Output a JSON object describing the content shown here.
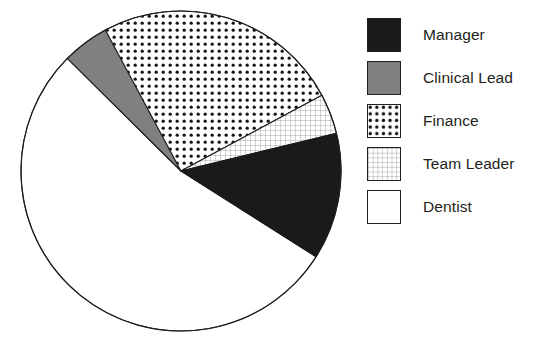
{
  "chart_data": {
    "type": "pie",
    "title": "",
    "subtitle": "",
    "xlabel": "",
    "ylabel": "",
    "grid": false,
    "legend_position": "right",
    "center": {
      "x": 181,
      "y": 171
    },
    "radius": 160,
    "categories": [
      "Manager",
      "Clinical Lead",
      "Finance",
      "Team Leader",
      "Dentist"
    ],
    "values": [
      12.8,
      4.8,
      25.0,
      4.1,
      53.3
    ],
    "units": "percent",
    "slices": [
      {
        "label": "Manager",
        "value": 12.8,
        "fill_style": "solid-black",
        "color": "#1a1a1a",
        "start_angle_deg": -32.4,
        "end_angle_deg": 13.6,
        "sweep_deg": 46.0
      },
      {
        "label": "Clinical Lead",
        "value": 4.8,
        "fill_style": "solid-gray",
        "color": "#808080",
        "start_angle_deg": 118.2,
        "end_angle_deg": 135.3,
        "sweep_deg": 17.1
      },
      {
        "label": "Finance",
        "value": 25.0,
        "fill_style": "dotted",
        "color": "#ffffff",
        "start_angle_deg": 28.3,
        "end_angle_deg": 118.2,
        "sweep_deg": 89.9
      },
      {
        "label": "Team Leader",
        "value": 4.1,
        "fill_style": "grid",
        "color": "#ffffff",
        "start_angle_deg": 13.6,
        "end_angle_deg": 28.3,
        "sweep_deg": 14.7
      },
      {
        "label": "Dentist",
        "value": 53.3,
        "fill_style": "solid-white",
        "color": "#ffffff",
        "start_angle_deg": 135.3,
        "end_angle_deg": 327.6,
        "sweep_deg": 192.3
      }
    ],
    "outline_color": "#231f20"
  },
  "legend": {
    "items": [
      {
        "label": "Manager",
        "swatch": "solid-black-swatch"
      },
      {
        "label": "Clinical Lead",
        "swatch": "solid-gray-swatch"
      },
      {
        "label": "Finance",
        "swatch": "dotted-swatch"
      },
      {
        "label": "Team Leader",
        "swatch": "grid-swatch"
      },
      {
        "label": "Dentist",
        "swatch": "solid-white-swatch"
      }
    ]
  }
}
